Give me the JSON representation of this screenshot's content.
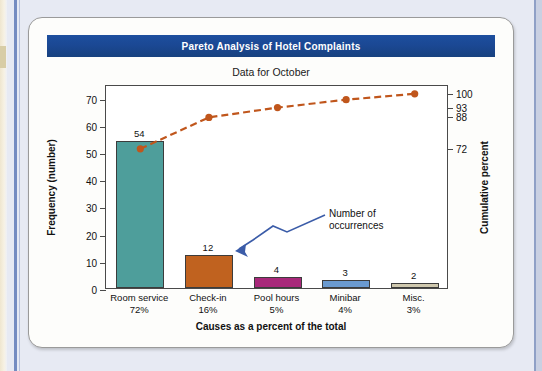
{
  "page": {
    "background_color": "#e7eaf3",
    "card_background": "#fdfdfb"
  },
  "banner": {
    "title": "Pareto Analysis of Hotel Complaints",
    "background_color": "#1b4894",
    "text_color": "#ffffff"
  },
  "subtitle": "Data for October",
  "annotation": {
    "line1": "Number of",
    "line2": "occurrences",
    "arrow_color": "#3b5ca8"
  },
  "chart_data": {
    "type": "bar",
    "title": "Pareto Analysis of Hotel Complaints",
    "subtitle": "Data for October",
    "xlabel": "Causes as a percent of the total",
    "ylabel": "Frequency (number)",
    "y2label": "Cumulative percent",
    "grid": false,
    "legend": "none",
    "categories": [
      "Room service",
      "Check-in",
      "Pool hours",
      "Minibar",
      "Misc."
    ],
    "category_percents": [
      "72%",
      "16%",
      "5%",
      "4%",
      "3%"
    ],
    "values": [
      54,
      12,
      4,
      3,
      2
    ],
    "bar_labels": [
      "54",
      "12",
      "4",
      "3",
      "2"
    ],
    "bar_colors": [
      "#4e9e9b",
      "#c0621f",
      "#a8287a",
      "#6a9ad0",
      "#cfc8ae"
    ],
    "ylim": [
      0,
      75
    ],
    "yticks": [
      0,
      10,
      20,
      30,
      40,
      50,
      60,
      70
    ],
    "ytick_labels": [
      "0",
      "10",
      "20",
      "30",
      "40",
      "50",
      "60",
      "70"
    ],
    "y2ticks": [
      72,
      88,
      93,
      100
    ],
    "y2tick_labels": [
      "72",
      "88",
      "93",
      "100"
    ],
    "y2lim": [
      0,
      104
    ],
    "cumulative_series": {
      "name": "Cumulative percent",
      "values": [
        72,
        88,
        93,
        97,
        100
      ],
      "color": "#c0561c",
      "style": "dashed",
      "marker": "circle"
    }
  }
}
